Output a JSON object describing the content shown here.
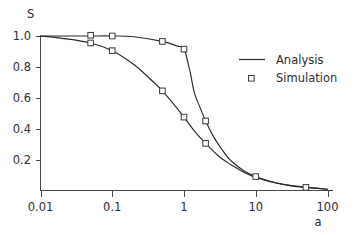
{
  "chart_data": {
    "type": "line",
    "title": "",
    "xlabel": "a",
    "ylabel": "S",
    "xscale": "log",
    "yscale": "linear",
    "xlim": [
      0.01,
      100
    ],
    "ylim": [
      0.0,
      1.0
    ],
    "grid": false,
    "legend_position": "upper right",
    "xticks": [
      "0.01",
      "0.1",
      "1",
      "10",
      "100"
    ],
    "xtick_values": [
      0.01,
      0.1,
      1,
      10,
      100
    ],
    "yticks": [
      "1.0",
      "0.8",
      "0.6",
      "0.4",
      "0.2"
    ],
    "ytick_values": [
      1.0,
      0.8,
      0.6,
      0.4,
      0.2
    ],
    "series": [
      {
        "name": "Analysis",
        "style": "line",
        "x": [
          0.01,
          0.02,
          0.05,
          0.1,
          0.2,
          0.5,
          0.8,
          1.0,
          1.2,
          1.4,
          1.7,
          2.0,
          2.5,
          3.0,
          4.0,
          5.0,
          7.0,
          10.0,
          15.0,
          20.0,
          30.0,
          50.0,
          100.0
        ],
        "values": [
          1.0,
          1.0,
          1.0,
          1.0,
          0.995,
          0.965,
          0.935,
          0.915,
          0.78,
          0.63,
          0.53,
          0.45,
          0.36,
          0.3,
          0.22,
          0.175,
          0.125,
          0.09,
          0.062,
          0.048,
          0.033,
          0.021,
          0.008
        ]
      },
      {
        "name": "Analysis-2",
        "style": "line",
        "x": [
          0.01,
          0.02,
          0.05,
          0.1,
          0.2,
          0.35,
          0.5,
          0.7,
          1.0,
          1.4,
          2.0,
          3.0,
          4.0,
          5.0,
          7.0,
          10.0,
          15.0,
          20.0,
          30.0,
          50.0,
          100.0
        ],
        "values": [
          1.0,
          0.985,
          0.955,
          0.905,
          0.815,
          0.715,
          0.645,
          0.565,
          0.475,
          0.385,
          0.305,
          0.225,
          0.182,
          0.155,
          0.115,
          0.085,
          0.06,
          0.047,
          0.032,
          0.02,
          0.008
        ]
      },
      {
        "name": "Simulation",
        "style": "markers",
        "marker": "open-square",
        "x": [
          0.05,
          0.1,
          0.5,
          1.0,
          2.0,
          10.0,
          50.0
        ],
        "values": [
          1.005,
          1.0,
          0.965,
          0.915,
          0.45,
          0.09,
          0.02
        ]
      },
      {
        "name": "Simulation-2",
        "style": "markers",
        "marker": "open-square",
        "x": [
          0.05,
          0.1,
          0.5,
          1.0,
          2.0
        ],
        "values": [
          0.955,
          0.905,
          0.645,
          0.475,
          0.305
        ]
      }
    ]
  },
  "legend": {
    "items": [
      {
        "label": "Analysis",
        "symbol": "line"
      },
      {
        "label": "Simulation",
        "symbol": "open-square"
      }
    ]
  },
  "colors": {
    "line": "#2a2a2a",
    "axis": "#4a4a4a",
    "marker_fill": "#ffffff",
    "marker_stroke": "#3a3a3a",
    "text": "#2e2e2e",
    "background": "#ffffff"
  }
}
